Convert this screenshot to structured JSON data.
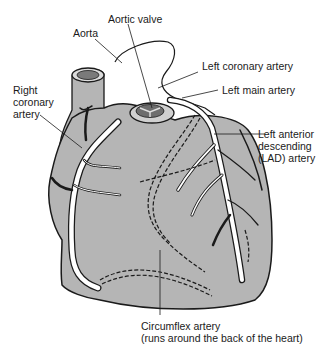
{
  "diagram": {
    "type": "anatomical illustration",
    "colors": {
      "heart_fill": "#b5b5b5",
      "outline": "#1a1a1a",
      "artery_fill": "#ffffff",
      "background": "#ffffff"
    },
    "labels": {
      "aortic_valve": "Aortic valve",
      "aorta": "Aorta",
      "left_coronary": "Left coronary artery",
      "left_main": "Left main artery",
      "right_coronary": "Right\ncoronary\nartery",
      "lad": "Left anterior\ndescending\n(LAD) artery",
      "circumflex": "Circumflex artery\n(runs around the back of the heart)"
    }
  }
}
